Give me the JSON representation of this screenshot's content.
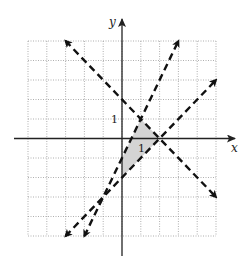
{
  "chart_data": {
    "type": "diagram",
    "title": "",
    "xlabel": "x",
    "ylabel": "y",
    "xlim": [
      -5,
      5
    ],
    "ylim": [
      -5,
      5
    ],
    "grid": true,
    "tick_labels": {
      "x": [
        "1"
      ],
      "y": [
        "1"
      ]
    },
    "lines": [
      {
        "name": "line-a",
        "equation": "y = -x + 2",
        "style": "dashed",
        "from": [
          -3,
          5
        ],
        "to": [
          5,
          -3
        ],
        "arrows": "both"
      },
      {
        "name": "line-b",
        "equation": "y = 2x - 1",
        "style": "dashed",
        "from": [
          -2,
          -5
        ],
        "to": [
          3,
          5
        ],
        "arrows": "both"
      },
      {
        "name": "line-c",
        "equation": "y = x - 2",
        "style": "dashed",
        "from": [
          -3,
          -5
        ],
        "to": [
          5,
          3
        ],
        "arrows": "both"
      }
    ],
    "shaded_region": {
      "vertices": [
        [
          1,
          1
        ],
        [
          2,
          0
        ],
        [
          0,
          -2
        ],
        [
          0,
          -1
        ]
      ],
      "color": "#d4d4d4"
    }
  },
  "labels": {
    "x_axis": "x",
    "y_axis": "y",
    "x_tick": "1",
    "y_tick": "1"
  },
  "colors": {
    "line": "#111111",
    "grid": "#9a9a9a",
    "shade": "#d4d4d4"
  }
}
